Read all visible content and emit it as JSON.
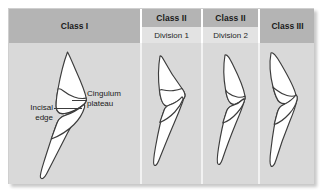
{
  "figure": {
    "background_color": "#d9d9d9",
    "header_dark_color": "#b4b4b4",
    "header_light_color": "#e3e3e3",
    "divider_color": "#f2f2f2",
    "outline_color": "#3c3c3c",
    "fill_color": "#ffffff"
  },
  "columns": [
    {
      "id": "class-1",
      "title": "Class I",
      "subtitle": "",
      "header_style": "full",
      "tooth_label": "Class I incisor relationship diagram"
    },
    {
      "id": "class-2-div-1",
      "title": "Class II",
      "subtitle": "Division 1",
      "header_style": "split",
      "tooth_label": "Class II Division 1 incisor relationship diagram"
    },
    {
      "id": "class-2-div-2",
      "title": "Class II",
      "subtitle": "Division 2",
      "header_style": "split",
      "tooth_label": "Class II Division 2 incisor relationship diagram"
    },
    {
      "id": "class-3",
      "title": "Class III",
      "subtitle": "",
      "header_style": "full",
      "tooth_label": "Class III incisor relationship diagram"
    }
  ],
  "annotations": {
    "incisal_edge": {
      "line1": "Incisal",
      "line2": "edge"
    },
    "cingulum_plateau": {
      "line1": "Cingulum",
      "line2": "plateau"
    }
  }
}
